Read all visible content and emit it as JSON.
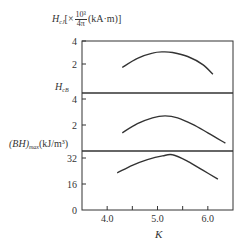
{
  "chart_data": {
    "type": "line",
    "layout": "three vertically stacked panels sharing x axis",
    "xlabel": "K",
    "xlim": [
      3.5,
      6.5
    ],
    "x_ticks": [
      4.0,
      4.5,
      5.0,
      5.5,
      6.0
    ],
    "x_tick_labels": [
      "4.0",
      "5.0",
      "6.0"
    ],
    "grid": false,
    "panels": [
      {
        "ylabel_main": "H",
        "ylabel_sub": "cJ",
        "ylabel_unit_prefix": "[×",
        "ylabel_frac_num": "10³",
        "ylabel_frac_den": "4π",
        "ylabel_unit_suffix": "(kA·m)]",
        "ylim": [
          0,
          4
        ],
        "y_ticks": [
          2,
          4
        ],
        "y_tick_labels": [
          "2",
          "4"
        ],
        "series": [
          {
            "name": "H_cJ",
            "x": [
              4.3,
              4.6,
              4.9,
              5.1,
              5.3,
              5.6,
              5.9,
              6.1
            ],
            "y": [
              1.7,
              2.5,
              2.95,
              3.05,
              3.0,
              2.65,
              1.95,
              1.1
            ]
          }
        ]
      },
      {
        "ylabel_main": "H",
        "ylabel_sub": "cB",
        "ylim": [
          0,
          4.5
        ],
        "y_ticks": [
          2,
          4
        ],
        "y_tick_labels": [
          "2",
          "4"
        ],
        "series": [
          {
            "name": "H_cB",
            "x": [
              4.3,
              4.6,
              4.9,
              5.15,
              5.4,
              5.7,
              6.0,
              6.35
            ],
            "y": [
              1.4,
              2.1,
              2.55,
              2.7,
              2.55,
              2.05,
              1.4,
              0.6
            ]
          }
        ]
      },
      {
        "ylabel_main": "(BH)",
        "ylabel_sub": "max",
        "ylabel_unit": "(kJ/m³)",
        "ylim": [
          0,
          36
        ],
        "y_ticks": [
          0,
          16,
          32
        ],
        "y_tick_labels": [
          "0",
          "16",
          "32"
        ],
        "series": [
          {
            "name": "(BH)max",
            "x": [
              4.2,
              4.5,
              4.8,
              5.1,
              5.3,
              5.6,
              5.9,
              6.2
            ],
            "y": [
              22.8,
              27.5,
              31.0,
              33.3,
              34.0,
              30.0,
              24.5,
              19.0
            ]
          }
        ]
      }
    ]
  },
  "labels": {
    "panel1": {
      "main": "H",
      "sub": "cJ",
      "prefix": "[×",
      "num": "10³",
      "den": "4π",
      "suffix": "(kA·m)]"
    },
    "panel2": {
      "main": "H",
      "sub": "cB"
    },
    "panel3": {
      "main": "(BH)",
      "sub": "max",
      "unit": "(kJ/m³)"
    },
    "xlabel": "K"
  }
}
